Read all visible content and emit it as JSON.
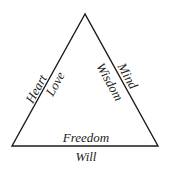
{
  "diagram": {
    "shape": "triangle",
    "left_side": {
      "outer": "Heart",
      "inner": "Love"
    },
    "right_side": {
      "outer": "Mind",
      "inner": "Wisdom"
    },
    "bottom_side": {
      "inner": "Freedom",
      "outer": "Will"
    },
    "stroke_color": "#1a1a1a",
    "text_color": "#222222"
  }
}
